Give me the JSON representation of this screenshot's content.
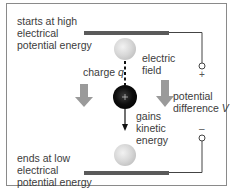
{
  "diagram": {
    "title": "",
    "labels": {
      "start": [
        "starts at high",
        "electrical",
        "potential energy"
      ],
      "end": [
        "ends at low",
        "electrical",
        "potential energy"
      ],
      "charge_prefix": "charge ",
      "charge_var": "q",
      "field": [
        "electric",
        "field"
      ],
      "gains": [
        "gains",
        "kinetic",
        "energy"
      ],
      "potential": [
        "potential"
      ],
      "difference_prefix": "difference ",
      "difference_var": "V",
      "plus_terminal": "+",
      "minus_terminal": "–",
      "charge_sign": "+"
    },
    "colors": {
      "frame": "#8a8a8a",
      "plate": "#5a5a5a",
      "wire": "#444444",
      "field_arrow": "#9a9a9a",
      "charge_ball": "#111111",
      "ghost_ball": "#d6d6d6",
      "motion_arrow": "#111111",
      "text": "#3c3c3c"
    }
  }
}
